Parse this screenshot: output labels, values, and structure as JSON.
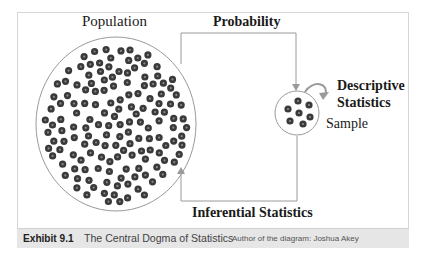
{
  "diagram": {
    "population_label": "Population",
    "probability_label": "Probability",
    "descriptive_label_line1": "Descriptive",
    "descriptive_label_line2": "Statistics",
    "sample_label": "Sample",
    "inferential_label": "Inferential Statistics",
    "population_dot_count": 150,
    "sample_dot_count": 7,
    "colors": {
      "line": "#9a9a9a",
      "dot": "#3a3a3a",
      "dot_center": "#8a8a8a",
      "caption_bg": "#e6e6e6",
      "frame": "#d6d6d6"
    }
  },
  "caption": {
    "exhibit": "Exhibit 9.1",
    "title": "The Central Dogma of Statistics",
    "author": "Author of the diagram: Joshua Akey"
  }
}
